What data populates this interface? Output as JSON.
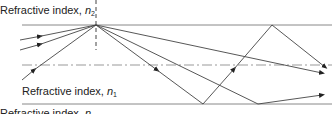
{
  "figure": {
    "type": "ray-diagram"
  },
  "labels": {
    "top_prefix": "Refractive index, ",
    "top_symbol": "n",
    "top_subscript": "2",
    "middle_prefix": "Refractive index, ",
    "middle_symbol": "n",
    "middle_subscript": "1",
    "bottom_prefix": "Refractive index, ",
    "bottom_symbol": "n",
    "bottom_subscript": ""
  },
  "colors": {
    "line": "#444444",
    "boundary": "#888888",
    "axis": "#999999",
    "text": "#222222"
  },
  "geometry": {
    "top_boundary_y": 25,
    "bottom_boundary_y": 104,
    "axis_y": 65,
    "normal_x": 96,
    "apex": [
      96,
      25
    ]
  }
}
